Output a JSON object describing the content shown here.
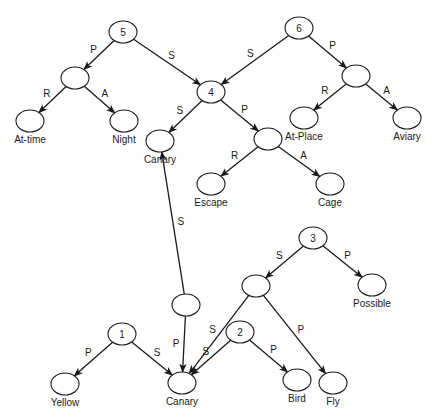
{
  "diagram": {
    "type": "semantic-network",
    "colors": {
      "line": "#1a1a1a",
      "background": "#ffffff"
    },
    "nodes": [
      {
        "id": "n5",
        "label": "5",
        "kind": "proposition",
        "x": 123,
        "y": 32
      },
      {
        "id": "n6",
        "label": "6",
        "kind": "proposition",
        "x": 299,
        "y": 28
      },
      {
        "id": "n5p",
        "label": "",
        "kind": "empty",
        "x": 75,
        "y": 78
      },
      {
        "id": "attime",
        "label": "At-time",
        "kind": "concept",
        "x": 30,
        "y": 121
      },
      {
        "id": "night",
        "label": "Night",
        "kind": "concept",
        "x": 124,
        "y": 121
      },
      {
        "id": "n4",
        "label": "4",
        "kind": "proposition",
        "x": 211,
        "y": 92
      },
      {
        "id": "canary_top",
        "label": "Canary",
        "kind": "concept",
        "x": 160,
        "y": 141
      },
      {
        "id": "n6p",
        "label": "",
        "kind": "empty",
        "x": 356,
        "y": 76
      },
      {
        "id": "atplace",
        "label": "At-Place",
        "kind": "concept",
        "x": 304,
        "y": 118
      },
      {
        "id": "aviary",
        "label": "Aviary",
        "kind": "concept",
        "x": 407,
        "y": 118
      },
      {
        "id": "n4p",
        "label": "",
        "kind": "empty",
        "x": 268,
        "y": 139
      },
      {
        "id": "escape",
        "label": "Escape",
        "kind": "concept",
        "x": 211,
        "y": 184
      },
      {
        "id": "cage",
        "label": "Cage",
        "kind": "concept",
        "x": 330,
        "y": 184
      },
      {
        "id": "n3",
        "label": "3",
        "kind": "proposition",
        "x": 313,
        "y": 238
      },
      {
        "id": "n3s",
        "label": "",
        "kind": "empty",
        "x": 256,
        "y": 286
      },
      {
        "id": "possible",
        "label": "Possible",
        "kind": "concept",
        "x": 372,
        "y": 285
      },
      {
        "id": "nmid",
        "label": "",
        "kind": "empty",
        "x": 186,
        "y": 305
      },
      {
        "id": "n1",
        "label": "1",
        "kind": "proposition",
        "x": 122,
        "y": 334
      },
      {
        "id": "n2",
        "label": "2",
        "kind": "proposition",
        "x": 240,
        "y": 332
      },
      {
        "id": "yellow",
        "label": "Yellow",
        "kind": "concept",
        "x": 65,
        "y": 384
      },
      {
        "id": "canary_bottom",
        "label": "Canary",
        "kind": "concept",
        "x": 182,
        "y": 383
      },
      {
        "id": "bird",
        "label": "Bird",
        "kind": "concept",
        "x": 297,
        "y": 380
      },
      {
        "id": "fly",
        "label": "Fly",
        "kind": "concept",
        "x": 333,
        "y": 383
      }
    ],
    "edges": [
      {
        "from": "n5",
        "to": "n5p",
        "label": "P"
      },
      {
        "from": "n5",
        "to": "n4",
        "label": "S"
      },
      {
        "from": "n5p",
        "to": "attime",
        "label": "R"
      },
      {
        "from": "n5p",
        "to": "night",
        "label": "A"
      },
      {
        "from": "n6",
        "to": "n4",
        "label": "S"
      },
      {
        "from": "n6",
        "to": "n6p",
        "label": "P"
      },
      {
        "from": "n6p",
        "to": "atplace",
        "label": "R"
      },
      {
        "from": "n6p",
        "to": "aviary",
        "label": "A"
      },
      {
        "from": "n4",
        "to": "canary_top",
        "label": "S"
      },
      {
        "from": "n4",
        "to": "n4p",
        "label": "P"
      },
      {
        "from": "n4p",
        "to": "escape",
        "label": "R"
      },
      {
        "from": "n4p",
        "to": "cage",
        "label": "A"
      },
      {
        "from": "nmid",
        "to": "canary_top",
        "label": "S"
      },
      {
        "from": "nmid",
        "to": "canary_bottom",
        "label": "P"
      },
      {
        "from": "n3",
        "to": "n3s",
        "label": "S"
      },
      {
        "from": "n3",
        "to": "possible",
        "label": "P"
      },
      {
        "from": "n3s",
        "to": "canary_bottom",
        "label": "S"
      },
      {
        "from": "n3s",
        "to": "fly",
        "label": "P"
      },
      {
        "from": "n1",
        "to": "yellow",
        "label": "P"
      },
      {
        "from": "n1",
        "to": "canary_bottom",
        "label": "S"
      },
      {
        "from": "n2",
        "to": "canary_bottom",
        "label": "S"
      },
      {
        "from": "n2",
        "to": "bird",
        "label": "P"
      }
    ]
  }
}
